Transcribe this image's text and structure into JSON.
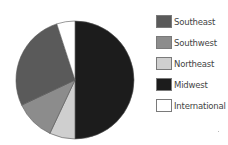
{
  "chart_data": {
    "type": "pie",
    "title": "",
    "start_angle_deg": 0,
    "direction": "clockwise",
    "slices": [
      {
        "label": "Midwest",
        "value": 50,
        "color": "#1c1c1c"
      },
      {
        "label": "Northeast",
        "value": 7,
        "color": "#cfcfcf"
      },
      {
        "label": "Southwest",
        "value": 11,
        "color": "#8c8c8c"
      },
      {
        "label": "Southeast",
        "value": 27,
        "color": "#5a5a5a"
      },
      {
        "label": "International",
        "value": 5,
        "color": "#ffffff"
      }
    ],
    "legend_position": "right",
    "legend": [
      {
        "label": "Southeast",
        "color": "#5a5a5a"
      },
      {
        "label": "Southwest",
        "color": "#8c8c8c"
      },
      {
        "label": "Northeast",
        "color": "#cfcfcf"
      },
      {
        "label": "Midwest",
        "color": "#1c1c1c"
      },
      {
        "label": "International",
        "color": "#ffffff"
      }
    ]
  },
  "geometry": {
    "cx": 75,
    "cy": 80,
    "r": 59
  }
}
